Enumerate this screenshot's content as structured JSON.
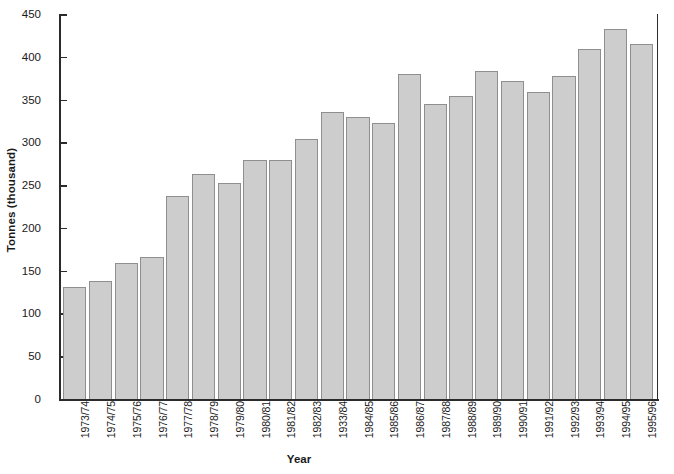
{
  "chart_data": {
    "type": "bar",
    "title": "",
    "xlabel": "Year",
    "ylabel": "Tonnes (thousand)",
    "ylim": [
      0,
      450
    ],
    "ytick_step": 50,
    "yticks": [
      0,
      50,
      100,
      150,
      200,
      250,
      300,
      350,
      400,
      450
    ],
    "ytick_labels": [
      "0",
      "50",
      "100",
      "150",
      "200",
      "250",
      "300",
      "350",
      "400",
      "450"
    ],
    "grid": false,
    "legend": null,
    "bar_color": "#cdcdcd",
    "bar_edge_color": "#8f8f8f",
    "axis_color": "#2b2b2b",
    "categories": [
      "1973/74",
      "1974/75",
      "1975/76",
      "1976/77",
      "1977/78",
      "1978/79",
      "1979/80",
      "1980/81",
      "1981/82",
      "1982/83",
      "1933/84",
      "1984/85",
      "1985/86",
      "1986/87",
      "1987/88",
      "1988/89",
      "1989/90",
      "1990/91",
      "1991/92",
      "1992/93",
      "1993/94",
      "1994/95",
      "1995/96"
    ],
    "values": [
      131,
      138,
      159,
      166,
      237,
      263,
      253,
      279,
      279,
      304,
      335,
      330,
      323,
      380,
      345,
      354,
      383,
      372,
      359,
      378,
      409,
      433,
      415
    ]
  }
}
